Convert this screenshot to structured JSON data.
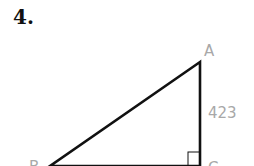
{
  "problem": {
    "number": "4."
  },
  "diagram": {
    "type": "right-triangle",
    "vertices": {
      "A": {
        "label": "A",
        "x": 200,
        "y": 62
      },
      "B": {
        "label": "B",
        "x": 50,
        "y": 166
      },
      "C": {
        "label": "C",
        "x": 200,
        "y": 166
      }
    },
    "side_labels": [
      {
        "side": "AC",
        "text": "423"
      }
    ],
    "right_angle_at": "C",
    "colors": {
      "lines": "#111111",
      "labels": "#a8a8a8"
    }
  }
}
